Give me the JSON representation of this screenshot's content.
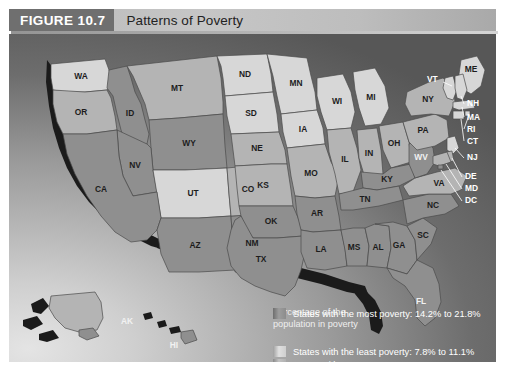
{
  "header": {
    "figure_number": "FIGURE 10.7",
    "title": "Patterns of Poverty"
  },
  "legend": {
    "title_line1": "Percentage of the",
    "title_line2": "population in poverty",
    "items": [
      {
        "swatch": "least-poverty-swatch",
        "label": "States with the least poverty: 7.8%  to 11.1%",
        "range_low": 7.8,
        "range_high": 11.1
      },
      {
        "swatch": "average-poverty-swatch",
        "label": "States with average poverty: 11.4%  to 13.6%",
        "range_low": 11.4,
        "range_high": 13.6
      },
      {
        "swatch": "most-poverty-swatch",
        "label": "States with the most poverty: 14.2%  to 21.8%",
        "range_low": 14.2,
        "range_high": 21.8
      }
    ]
  },
  "map": {
    "state_labels": [
      "WA",
      "OR",
      "ID",
      "MT",
      "WY",
      "NV",
      "UT",
      "CA",
      "AZ",
      "NM",
      "CO",
      "ND",
      "SD",
      "NE",
      "KS",
      "OK",
      "TX",
      "MN",
      "IA",
      "MO",
      "AR",
      "LA",
      "WI",
      "IL",
      "MI",
      "IN",
      "OH",
      "KY",
      "TN",
      "MS",
      "AL",
      "GA",
      "FL",
      "SC",
      "NC",
      "VA",
      "WV",
      "PA",
      "NY",
      "ME",
      "VT",
      "NH",
      "MA",
      "RI",
      "CT",
      "NJ",
      "DE",
      "MD",
      "DC",
      "AK",
      "HI"
    ],
    "callout_labels": [
      "VT",
      "NH",
      "MA",
      "RI",
      "CT",
      "NJ",
      "DE",
      "MD",
      "DC"
    ],
    "inset_labels": [
      "AK",
      "HI"
    ]
  },
  "colors": {
    "least": "#d7d7d7",
    "average": "#b4b4b4",
    "most": "#8f8f8f",
    "header_block": "#6f6f6f",
    "header_band": "#c6c6c6",
    "legend_text": "#ffffff"
  }
}
